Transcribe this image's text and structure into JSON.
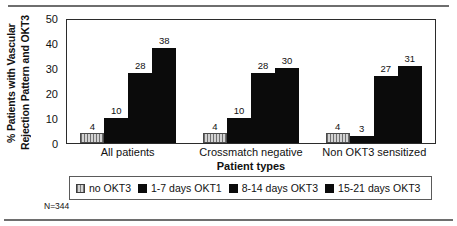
{
  "figure": {
    "n_note": "N=344"
  },
  "chart_data": {
    "type": "bar",
    "title": "",
    "xlabel": "Patient types",
    "ylabel_line1": "% Patients with Vascular",
    "ylabel_line2": "Rejection Pattern and OKT3",
    "categories": [
      "All patients",
      "Crossmatch negative",
      "Non OKT3 sensitized"
    ],
    "series": [
      {
        "name": "no OKT3",
        "values": [
          4,
          4,
          4
        ],
        "swatch": "hatched-gray",
        "color": "#c9c9c9"
      },
      {
        "name": "1-7 days OKT1",
        "values": [
          10,
          10,
          3
        ],
        "swatch": "solid-black",
        "color": "#0b0b0b"
      },
      {
        "name": "8-14 days OKT3",
        "values": [
          28,
          28,
          27
        ],
        "swatch": "solid-black",
        "color": "#0b0b0b"
      },
      {
        "name": "15-21 days OKT3",
        "values": [
          38,
          30,
          31
        ],
        "swatch": "solid-black",
        "color": "#0b0b0b"
      }
    ],
    "yticks": [
      0,
      10,
      20,
      30,
      40,
      50
    ],
    "ylim": [
      0,
      50
    ],
    "grid": false,
    "legend_position": "bottom",
    "value_labels": true
  }
}
